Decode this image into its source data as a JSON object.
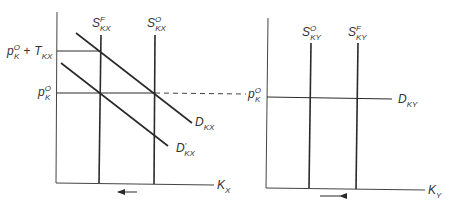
{
  "caption_fragment": "Exhibit 4-5",
  "left_panel": {
    "x_axis_label": {
      "base": "K",
      "sub": "X"
    },
    "supply_foreign": {
      "base": "S",
      "sup": "F",
      "sub": "KX"
    },
    "supply_original": {
      "base": "S",
      "sup": "O",
      "sub": "KX"
    },
    "demand": {
      "base": "D",
      "sub": "KX"
    },
    "demand_shifted": {
      "base": "D",
      "prime": "′",
      "sub": "KX"
    },
    "price_with_tax": {
      "base": "p",
      "sup": "O",
      "sub": "K",
      "plus": "+",
      "tax_base": "T",
      "tax_sub": "KX"
    },
    "price_original": {
      "base": "p",
      "sup": "O",
      "sub": "K"
    },
    "shift_arrow_direction": "left"
  },
  "right_panel": {
    "x_axis_label": {
      "base": "K",
      "sub": "Y"
    },
    "supply_original": {
      "base": "S",
      "sup": "O",
      "sub": "KY"
    },
    "supply_foreign": {
      "base": "S",
      "sup": "F",
      "sub": "KY"
    },
    "demand": {
      "base": "D",
      "sub": "KY"
    },
    "price_original": {
      "base": "p",
      "sup": "O",
      "sub": "K"
    },
    "shift_arrow_direction": "right"
  }
}
